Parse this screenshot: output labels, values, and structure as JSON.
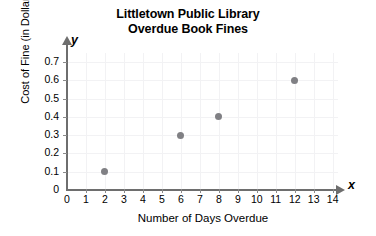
{
  "chart_data": {
    "type": "scatter",
    "title": "Littletown Public Library Overdue Book Fines",
    "title_lines": [
      "Littletown Public Library",
      "Overdue Book Fines"
    ],
    "xlabel": "Number of Days Overdue",
    "ylabel": "Cost of Fine (in Dollars)",
    "xlim": [
      0,
      14
    ],
    "ylim": [
      0,
      0.7
    ],
    "grid": true,
    "legend": "none",
    "x_ticks": [
      "0",
      "1",
      "2",
      "3",
      "4",
      "5",
      "6",
      "7",
      "8",
      "9",
      "10",
      "11",
      "12",
      "13",
      "14"
    ],
    "y_ticks": [
      "0",
      "0.1",
      "0.2",
      "0.3",
      "0.4",
      "0.5",
      "0.6",
      "0.7"
    ],
    "x_axis_variable": "x",
    "y_axis_variable": "y",
    "points": [
      {
        "x": 2,
        "y": 0.1
      },
      {
        "x": 6,
        "y": 0.3
      },
      {
        "x": 8,
        "y": 0.4
      },
      {
        "x": 12,
        "y": 0.6
      }
    ],
    "point_color": "#808084",
    "grid_color": "#f2f2f4",
    "axis_color": "#6e6e6e"
  }
}
